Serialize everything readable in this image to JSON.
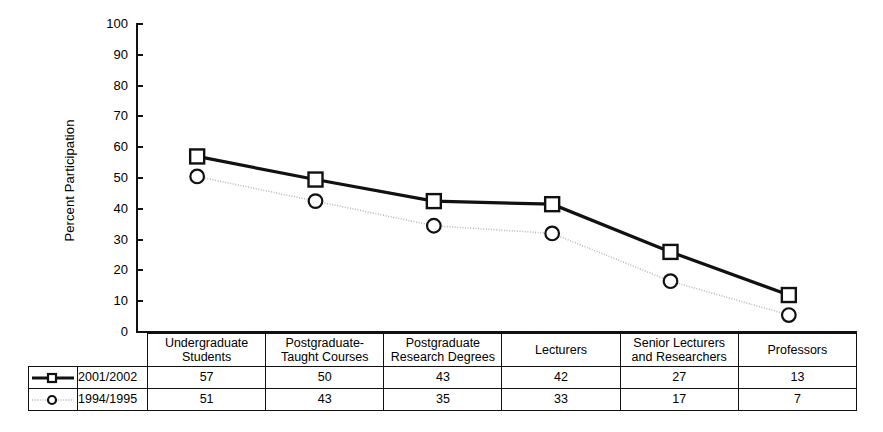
{
  "chart_data": {
    "type": "line",
    "title": "",
    "xlabel": "",
    "ylabel": "Percent Participation",
    "ylim": [
      0,
      100
    ],
    "ytick_step": 10,
    "yticks": [
      100,
      90,
      80,
      70,
      60,
      50,
      40,
      30,
      20,
      10,
      0
    ],
    "grid": false,
    "legend_position": "bottom-left",
    "categories": [
      "Undergraduate Students",
      "Postgraduate-Taught Courses",
      "Postgraduate Research Degrees",
      "Lecturers",
      "Senior Lecturers and Researchers",
      "Professors"
    ],
    "series": [
      {
        "name": "2001/2002",
        "values": [
          57,
          50,
          43,
          42,
          27,
          13
        ],
        "plotted_values": [
          57,
          49.5,
          42.5,
          41.5,
          26,
          12
        ],
        "marker": "square-open",
        "linestyle": "solid",
        "color": "#111111"
      },
      {
        "name": "1994/1995",
        "values": [
          51,
          43,
          35,
          33,
          17,
          7
        ],
        "plotted_values": [
          50.5,
          42.5,
          34.5,
          32,
          16.5,
          5.5
        ],
        "marker": "circle-open",
        "linestyle": "dotted",
        "color": "#b9b9b9"
      }
    ]
  },
  "axis": {
    "y_label": "Percent Participation",
    "y_ticks": [
      "100",
      "90",
      "80",
      "70",
      "60",
      "50",
      "40",
      "30",
      "20",
      "10",
      "0"
    ]
  },
  "table": {
    "headers": [
      [
        "Undergraduate",
        "Students"
      ],
      [
        "Postgraduate-",
        "Taught Courses"
      ],
      [
        "Postgraduate",
        "Research Degrees"
      ],
      [
        "Lecturers",
        ""
      ],
      [
        "Senior Lecturers",
        "and Researchers"
      ],
      [
        "Professors",
        ""
      ]
    ],
    "rows": [
      {
        "series": "2001/2002",
        "values": [
          "57",
          "50",
          "43",
          "42",
          "27",
          "13"
        ]
      },
      {
        "series": "1994/1995",
        "values": [
          "51",
          "43",
          "35",
          "33",
          "17",
          "7"
        ]
      }
    ]
  },
  "legend": {
    "items": [
      {
        "label": "2001/2002",
        "marker": "square-open",
        "linestyle": "solid",
        "color": "#111111"
      },
      {
        "label": "1994/1995",
        "marker": "circle-open",
        "linestyle": "dotted",
        "color": "#b9b9b9"
      }
    ]
  }
}
